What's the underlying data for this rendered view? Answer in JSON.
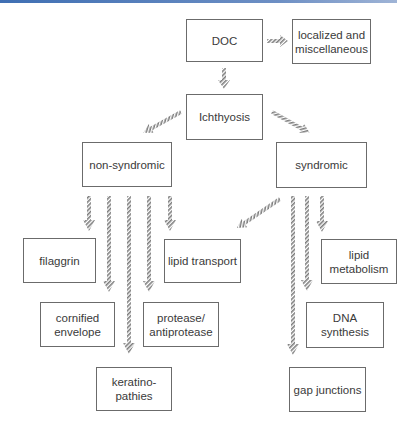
{
  "diagram": {
    "nodes": {
      "doc": "DOC",
      "localized": "localized and miscellaneous",
      "ichthyosis": "Ichthyosis",
      "non_syndromic": "non-syndromic",
      "syndromic": "syndromic",
      "filaggrin": "filaggrin",
      "lipid_transport": "lipid transport",
      "lipid_metabolism": "lipid metabolism",
      "cornified_envelope": "cornified envelope",
      "protease": "protease/ antiprotease",
      "dna_synthesis": "DNA synthesis",
      "keratinopathies": "keratino- pathies",
      "gap_junctions": "gap junctions"
    },
    "edges": [
      {
        "from": "DOC",
        "to": "localized and miscellaneous"
      },
      {
        "from": "DOC",
        "to": "Ichthyosis"
      },
      {
        "from": "Ichthyosis",
        "to": "non-syndromic"
      },
      {
        "from": "Ichthyosis",
        "to": "syndromic"
      },
      {
        "from": "non-syndromic",
        "to": "filaggrin"
      },
      {
        "from": "non-syndromic",
        "to": "cornified envelope"
      },
      {
        "from": "non-syndromic",
        "to": "keratinopathies"
      },
      {
        "from": "non-syndromic",
        "to": "protease/antiprotease"
      },
      {
        "from": "non-syndromic",
        "to": "lipid transport"
      },
      {
        "from": "syndromic",
        "to": "lipid transport"
      },
      {
        "from": "syndromic",
        "to": "gap junctions"
      },
      {
        "from": "syndromic",
        "to": "DNA synthesis"
      },
      {
        "from": "syndromic",
        "to": "lipid metabolism"
      }
    ],
    "colors": {
      "accent_line": "#3f6fb3",
      "box_border": "#6b6b6b",
      "arrow": "#8a8a8a"
    }
  }
}
